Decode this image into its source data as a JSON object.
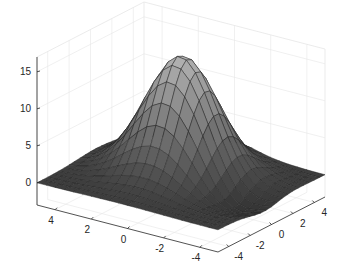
{
  "chart_data": {
    "type": "surface",
    "title": "",
    "xlabel": "",
    "ylabel": "",
    "zlabel": "",
    "grid": true,
    "colormap": "gray",
    "mesh_edges": true,
    "x_range": [
      -5,
      5
    ],
    "y_range": [
      -5,
      5
    ],
    "zlim": [
      -3,
      17
    ],
    "x_ticks": [
      -4,
      -2,
      0,
      2,
      4
    ],
    "y_ticks": [
      -4,
      -2,
      0,
      2,
      4
    ],
    "z_ticks": [
      0,
      5,
      10,
      15
    ],
    "x_tick_labels": [
      "-4",
      "-2",
      "0",
      "2",
      "4"
    ],
    "y_tick_labels": [
      "-4",
      "-2",
      "0",
      "2",
      "4"
    ],
    "z_tick_labels": [
      "0",
      "5",
      "10",
      "15"
    ],
    "grid_resolution": 21,
    "peak_z": 16,
    "min_z": -2.5
  },
  "colors": {
    "background": "#ffffff",
    "axis": "#262626",
    "grid": "#e6e6e6",
    "edge": "#222222",
    "surface_high": "#b0b0b0",
    "surface_low": "#2a2a2a"
  }
}
